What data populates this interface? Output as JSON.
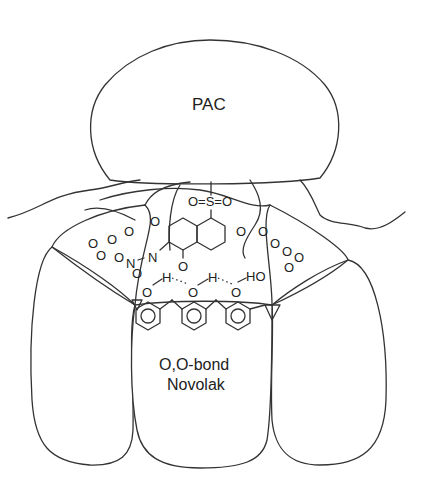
{
  "diagram": {
    "type": "schematic of molecular interaction",
    "labels": {
      "pac": "PAC",
      "novolak_line1": "O,O-bond",
      "novolak_line2": "Novolak"
    },
    "atoms": {
      "sulfonyl": "O=S=O",
      "o": "O",
      "n": "N",
      "h": "H",
      "ho": "HO"
    },
    "colors": {
      "stroke": "#333333",
      "background": "#ffffff"
    }
  }
}
